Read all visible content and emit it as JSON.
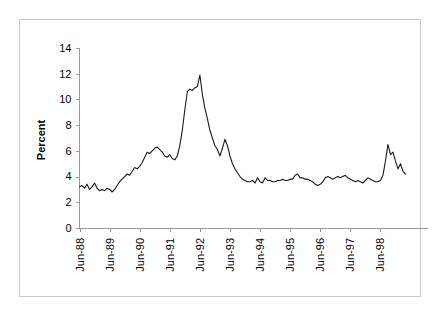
{
  "chart_data": {
    "type": "line",
    "title": "",
    "xlabel": "",
    "ylabel": "Percent",
    "ylim": [
      0,
      14
    ],
    "ytick_step": 2,
    "ytick_labels": [
      "0",
      "2",
      "4",
      "6",
      "8",
      "10",
      "12",
      "14"
    ],
    "ytick_values": [
      0,
      2,
      4,
      6,
      8,
      10,
      12,
      14
    ],
    "xtick_labels": [
      "Jun-88",
      "Jun-89",
      "Jun-90",
      "Jun-91",
      "Jun-92",
      "Jun-93",
      "Jun-94",
      "Jun-95",
      "Jun-96",
      "Jun-97",
      "Jun-98"
    ],
    "xtick_index": [
      0,
      12,
      24,
      36,
      48,
      60,
      72,
      84,
      96,
      108,
      120
    ],
    "grid": false,
    "legend": null,
    "legend_position": "none",
    "line_color": "#1a1a1a",
    "axis_color": "#9a9a9a",
    "frame_color": "#c9c9c9",
    "background_color": "#ffffff",
    "x_start_label": "Jun-88",
    "x_end_label": "Dec-98",
    "n_points": 127,
    "series": [
      {
        "name": "Percent",
        "values": [
          3.2,
          3.3,
          3.1,
          3.4,
          3.0,
          3.2,
          3.5,
          3.1,
          2.9,
          3.0,
          2.9,
          3.1,
          3.0,
          2.8,
          3.0,
          3.3,
          3.6,
          3.8,
          4.0,
          4.2,
          4.1,
          4.4,
          4.7,
          4.6,
          4.8,
          5.1,
          5.5,
          5.9,
          5.8,
          6.0,
          6.2,
          6.3,
          6.1,
          5.9,
          5.6,
          5.5,
          5.7,
          5.4,
          5.3,
          5.6,
          6.4,
          7.6,
          9.2,
          10.6,
          10.8,
          10.7,
          10.9,
          11.0,
          11.9,
          10.4,
          9.3,
          8.5,
          7.6,
          7.0,
          6.4,
          6.1,
          5.6,
          6.2,
          6.9,
          6.4,
          5.6,
          5.0,
          4.6,
          4.3,
          4.0,
          3.8,
          3.7,
          3.6,
          3.6,
          3.7,
          3.5,
          3.9,
          3.6,
          3.5,
          3.9,
          3.7,
          3.7,
          3.6,
          3.6,
          3.7,
          3.7,
          3.8,
          3.7,
          3.7,
          3.8,
          3.8,
          4.1,
          4.2,
          3.9,
          3.9,
          3.8,
          3.8,
          3.7,
          3.6,
          3.4,
          3.3,
          3.4,
          3.6,
          3.9,
          4.0,
          3.9,
          3.8,
          3.9,
          4.0,
          3.9,
          4.0,
          4.1,
          3.9,
          3.8,
          3.7,
          3.6,
          3.7,
          3.6,
          3.5,
          3.7,
          3.9,
          3.8,
          3.7,
          3.6,
          3.6,
          3.7,
          4.1,
          5.2,
          6.5,
          5.7,
          5.9,
          5.2,
          4.6,
          5.0,
          4.4,
          4.2
        ]
      }
    ]
  }
}
